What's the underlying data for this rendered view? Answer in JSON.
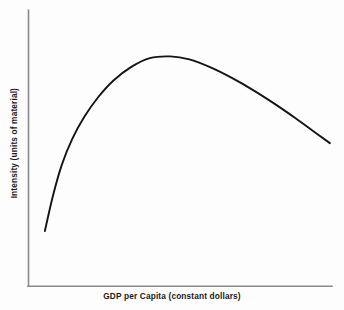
{
  "chart_data": {
    "type": "line",
    "title": "",
    "subtitle": "",
    "xlabel": "GDP per Capita (constant dollars)",
    "ylabel": "Intensity (units of material)",
    "legend": [],
    "legend_position": "none",
    "grid": false,
    "axis_ticks": false,
    "tick_labels_x": [],
    "tick_labels_y": [],
    "xlim": [
      0,
      100
    ],
    "ylim": [
      0,
      100
    ],
    "annotations": [],
    "series": [
      {
        "name": "Material intensity",
        "color": "#141414",
        "x": [
          5.4,
          8.0,
          11.0,
          14.5,
          18.5,
          23.0,
          28.0,
          34.0,
          40.0,
          46.7,
          53.0,
          60.0,
          67.0,
          74.0,
          81.0,
          88.0,
          95.0,
          99.3
        ],
        "y": [
          20.0,
          32.5,
          44.0,
          53.5,
          61.5,
          68.5,
          74.5,
          79.5,
          82.6,
          83.2,
          82.1,
          79.2,
          75.4,
          71.0,
          66.1,
          60.8,
          55.2,
          51.8
        ]
      }
    ]
  },
  "colors": {
    "axis": "#8a8a8a",
    "curve": "#141414",
    "background": "#fdfdfd",
    "label_text": "#1a1a1a"
  }
}
